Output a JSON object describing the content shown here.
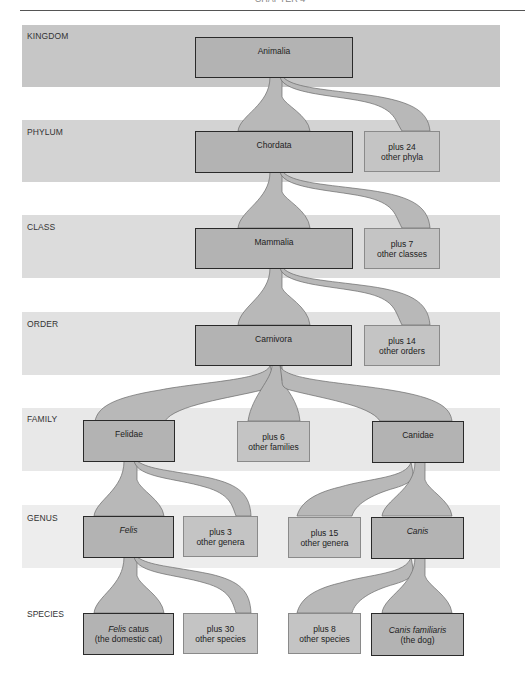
{
  "figure": {
    "header_fragment": "CHAPTER 4",
    "colors": {
      "band_kingdom": "#c6c6c6",
      "band_phylum": "#d3d3d3",
      "band_class": "#dcdcdc",
      "band_order": "#e1e1e1",
      "band_family": "#e8e8e8",
      "band_genus": "#ededed",
      "connector_fill": "#b8b8b8",
      "connector_stroke": "#6a6a6a",
      "main_box_fill": "#b3b3b3",
      "other_box_fill": "#c4c4c4"
    },
    "ranks": [
      {
        "label": "KINGDOM"
      },
      {
        "label": "PHYLUM"
      },
      {
        "label": "CLASS"
      },
      {
        "label": "ORDER"
      },
      {
        "label": "FAMILY"
      },
      {
        "label": "GENUS"
      },
      {
        "label": "SPECIES"
      }
    ],
    "nodes": {
      "animalia": {
        "line1": "Animalia"
      },
      "chordata": {
        "line1": "Chordata"
      },
      "other_phyla": {
        "line1": "plus 24",
        "line2": "other phyla"
      },
      "mammalia": {
        "line1": "Mammalia"
      },
      "other_classes": {
        "line1": "plus 7",
        "line2": "other classes"
      },
      "carnivora": {
        "line1": "Carnivora"
      },
      "other_orders": {
        "line1": "plus 14",
        "line2": "other orders"
      },
      "felidae": {
        "line1": "Felidae"
      },
      "other_families": {
        "line1": "plus 6",
        "line2": "other families"
      },
      "canidae": {
        "line1": "Canidae"
      },
      "felis": {
        "line1": "Felis"
      },
      "other_genera_cat": {
        "line1": "plus 3",
        "line2": "other genera"
      },
      "other_genera_dog": {
        "line1": "plus 15",
        "line2": "other genera"
      },
      "canis": {
        "line1": "Canis"
      },
      "felis_catus": {
        "genus": "Felis",
        "epithet": "catus",
        "line2": "(the domestic cat)"
      },
      "other_species_cat": {
        "line1": "plus 30",
        "line2": "other species"
      },
      "other_species_dog": {
        "line1": "plus 8",
        "line2": "other species"
      },
      "canis_familiaris": {
        "binomial": "Canis familiaris",
        "line2": "(the dog)"
      }
    }
  }
}
